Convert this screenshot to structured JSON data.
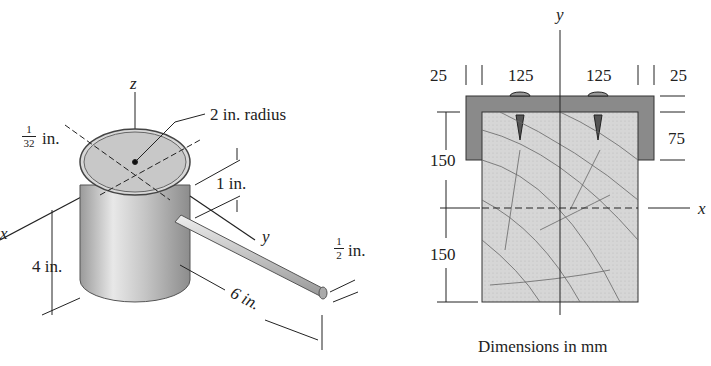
{
  "left_figure": {
    "axes": {
      "x": "x",
      "y": "y",
      "z": "z"
    },
    "labels": {
      "radius": "2 in. radius",
      "thickness_num": "1",
      "thickness_den": "32",
      "thickness_unit": "in.",
      "rod_offset": "1 in.",
      "height": "4 in.",
      "rod_length": "6 in.",
      "rod_dia_num": "1",
      "rod_dia_den": "2",
      "rod_dia_unit": "in."
    }
  },
  "right_figure": {
    "axes": {
      "x": "x",
      "y": "y"
    },
    "dims": {
      "left_flange": "25",
      "left_span": "125",
      "right_span": "125",
      "right_flange": "25",
      "lip_depth": "75",
      "upper_half": "150",
      "lower_half": "150"
    },
    "caption": "Dimensions in mm"
  },
  "colors": {
    "steel": "#8a8a8a",
    "wood": "#d4d4d4",
    "line": "#222222"
  }
}
